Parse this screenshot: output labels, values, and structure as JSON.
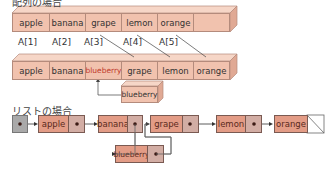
{
  "array_section": {
    "title": "配列の場合",
    "before": [
      "apple",
      "banana",
      "grape",
      "lemon",
      "orange",
      ""
    ],
    "indices": [
      "A[1]",
      "A[2]",
      "A[3]",
      "A[4]",
      "A[5]"
    ],
    "after": [
      "apple",
      "banana",
      "blueberry",
      "grape",
      "lemon",
      "orange"
    ],
    "inserted": "blueberry"
  },
  "list_section": {
    "title": "リストの場合",
    "nodes": [
      "apple",
      "banana",
      "grape",
      "lemon",
      "orange"
    ],
    "inserted": "blueberry"
  },
  "colors": {
    "array_cell": "#f1c2ae",
    "list_data": "#e39c86",
    "list_pointer": "#d2ada4",
    "head": "#a9a9a9",
    "highlight_text": "#c0392b"
  }
}
